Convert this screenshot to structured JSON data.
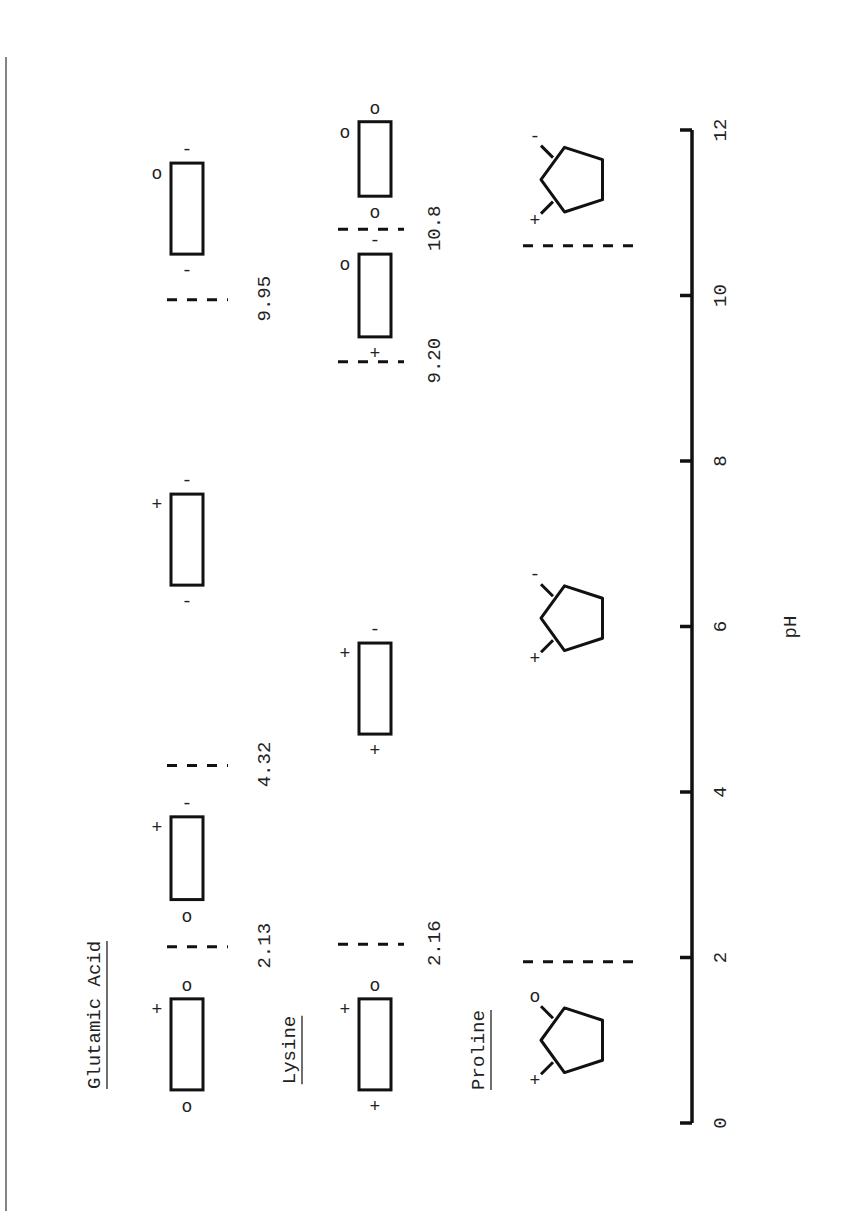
{
  "figure": {
    "orientation": "rotated-90-ccw",
    "axis": {
      "label": "pH",
      "ticks": [
        "0",
        "2",
        "4",
        "6",
        "8",
        "10",
        "12"
      ],
      "range": [
        0,
        12
      ]
    },
    "amino_acids": [
      {
        "name": "Glutamic Acid",
        "species": [
          {
            "ph_start": 0.4,
            "ph_end": 1.5,
            "top_end": "o",
            "bottom_end": "o",
            "side": "+",
            "note": "cationic form: +, o, o"
          },
          {
            "ph_start": 2.7,
            "ph_end": 3.7,
            "top_end": "-",
            "bottom_end": "o",
            "side": "+",
            "note": "+, -, o"
          },
          {
            "ph_start": 6.5,
            "ph_end": 7.6,
            "top_end": "-",
            "bottom_end": "-",
            "side": "+",
            "note": "+, -, -"
          },
          {
            "ph_start": 10.5,
            "ph_end": 11.6,
            "top_end": "-",
            "bottom_end": "-",
            "side": "o",
            "note": "o, -, -"
          }
        ],
        "pk_lines": [
          {
            "ph": 2.13,
            "label": "2.13"
          },
          {
            "ph": 4.32,
            "label": "4.32"
          },
          {
            "ph": 9.95,
            "label": "9.95"
          }
        ]
      },
      {
        "name": "Lysine",
        "species": [
          {
            "ph_start": 0.4,
            "ph_end": 1.5,
            "top_end": "o",
            "bottom_end": "+",
            "side": "+",
            "note": "+, o, +"
          },
          {
            "ph_start": 4.7,
            "ph_end": 5.8,
            "top_end": "-",
            "bottom_end": "+",
            "side": "+",
            "note": "+, -, +"
          },
          {
            "ph_start": 9.5,
            "ph_end": 10.5,
            "top_end": "-",
            "bottom_end": "+",
            "side": "o",
            "note": "o, -, +"
          },
          {
            "ph_start": 11.2,
            "ph_end": 12.1,
            "top_end": "o",
            "bottom_end": "o",
            "side": "o",
            "note": "o, o, o"
          }
        ],
        "pk_lines": [
          {
            "ph": 2.16,
            "label": "2.16"
          },
          {
            "ph": 9.2,
            "label": "9.20"
          },
          {
            "ph": 10.8,
            "label": "10.8"
          }
        ]
      },
      {
        "name": "Proline",
        "species": [
          {
            "ph_center": 1.0,
            "left_charge": "+",
            "right_charge": "o"
          },
          {
            "ph_center": 6.1,
            "left_charge": "+",
            "right_charge": "-"
          },
          {
            "ph_center": 11.4,
            "left_charge": "+",
            "right_charge": "-"
          }
        ],
        "pk_lines": [
          {
            "ph": 1.95,
            "label": ""
          },
          {
            "ph": 10.6,
            "label": ""
          }
        ]
      }
    ]
  }
}
